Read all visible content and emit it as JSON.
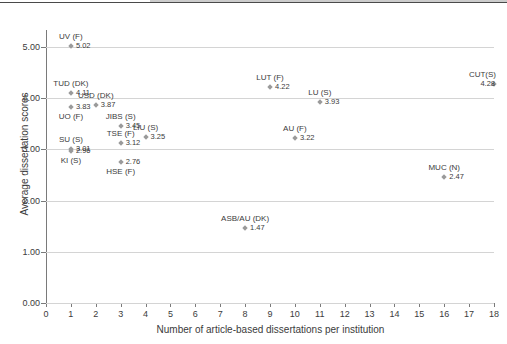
{
  "chart_data": {
    "type": "scatter",
    "title": "",
    "xlabel": "Number of article-based dissertations per institution",
    "ylabel": "Average dissertation scores",
    "xlim": [
      0,
      18
    ],
    "ylim": [
      0,
      5
    ],
    "xticks": [
      "0",
      "1",
      "2",
      "3",
      "4",
      "5",
      "6",
      "7",
      "8",
      "9",
      "10",
      "11",
      "12",
      "13",
      "14",
      "15",
      "16",
      "17",
      "18"
    ],
    "yticks": [
      "0.00",
      "1.00",
      "2.00",
      "3.00",
      "4.00",
      "5.00"
    ],
    "grid": "horizontal",
    "legend": "none",
    "marker_color": "#9a9a9a",
    "gridline_color": "#d4d4d4",
    "axis_color": "#7a7a7a",
    "points": [
      {
        "name": "UV (F)",
        "x": 1,
        "y": 5.02,
        "value": "5.02",
        "label_pos": "above"
      },
      {
        "name": "TUD (DK)",
        "x": 1,
        "y": 4.11,
        "value": "4.11",
        "label_pos": "above"
      },
      {
        "name": "UO (F)",
        "x": 1,
        "y": 3.83,
        "value": "3.83",
        "label_pos": "below"
      },
      {
        "name": "SU (S)",
        "x": 1,
        "y": 3.01,
        "value": "3.01",
        "label_pos": "above"
      },
      {
        "name": "KI (S)",
        "x": 1,
        "y": 2.96,
        "value": "2.96",
        "label_pos": "below"
      },
      {
        "name": "USD (DK)",
        "x": 2,
        "y": 3.87,
        "value": "3.87",
        "label_pos": "above"
      },
      {
        "name": "JIBS (S)",
        "x": 3,
        "y": 3.45,
        "value": "3.45",
        "label_pos": "above"
      },
      {
        "name": "TSE (F)",
        "x": 3,
        "y": 3.12,
        "value": "3.12",
        "label_pos": "above"
      },
      {
        "name": "HSE (F)",
        "x": 3,
        "y": 2.76,
        "value": "2.76",
        "label_pos": "below"
      },
      {
        "name": "LIU (S)",
        "x": 4,
        "y": 3.25,
        "value": "3.25",
        "label_pos": "above"
      },
      {
        "name": "ASB/AU (DK)",
        "x": 8,
        "y": 1.47,
        "value": "1.47",
        "label_pos": "above"
      },
      {
        "name": "LUT (F)",
        "x": 9,
        "y": 4.22,
        "value": "4.22",
        "label_pos": "above"
      },
      {
        "name": "AU (F)",
        "x": 10,
        "y": 3.22,
        "value": "3.22",
        "label_pos": "above"
      },
      {
        "name": "LU (S)",
        "x": 11,
        "y": 3.93,
        "value": "3.93",
        "label_pos": "above"
      },
      {
        "name": "MUC (N)",
        "x": 16,
        "y": 2.47,
        "value": "2.47",
        "label_pos": "above"
      },
      {
        "name": "CUT(S)",
        "x": 18,
        "y": 4.28,
        "value": "4.28",
        "label_pos": "above"
      }
    ]
  }
}
